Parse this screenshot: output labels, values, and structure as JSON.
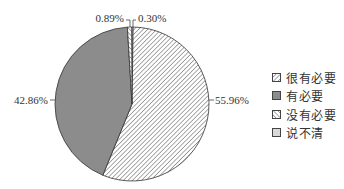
{
  "chart_data": {
    "type": "pie",
    "title": "",
    "categories": [
      "很有必要",
      "有必要",
      "没有必要",
      "说不清"
    ],
    "values": [
      55.96,
      42.86,
      0.89,
      0.3
    ],
    "labels": [
      "55.96%",
      "42.86%",
      "0.89%",
      "0.30%"
    ],
    "fills": [
      "hatch-back",
      "#8c8c8c",
      "hatch-forward",
      "#d9d9d9"
    ],
    "legend_position": "right"
  },
  "legend": {
    "items": [
      {
        "label": "很有必要",
        "pattern": "hatch-back"
      },
      {
        "label": "有必要",
        "pattern": "solid-gray"
      },
      {
        "label": "没有必要",
        "pattern": "hatch-forward"
      },
      {
        "label": "说不清",
        "pattern": "light-gray"
      }
    ]
  }
}
